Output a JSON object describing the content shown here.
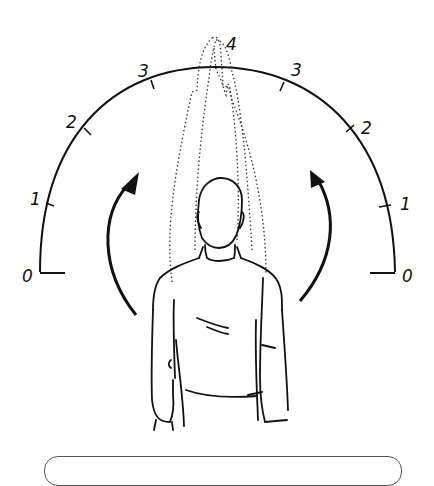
{
  "diagram": {
    "colors": {
      "line": "#111111",
      "dotted": "#333333",
      "caption_border": "#555555",
      "background": "#ffffff"
    },
    "scale_left": {
      "labels": [
        "0",
        "1",
        "2",
        "3"
      ]
    },
    "scale_right": {
      "labels": [
        "0",
        "1",
        "2",
        "3"
      ]
    },
    "top_label": "4",
    "arrows": [
      {
        "side": "left",
        "direction": "up"
      },
      {
        "side": "right",
        "direction": "up"
      }
    ],
    "caption_box": {
      "text": ""
    }
  }
}
